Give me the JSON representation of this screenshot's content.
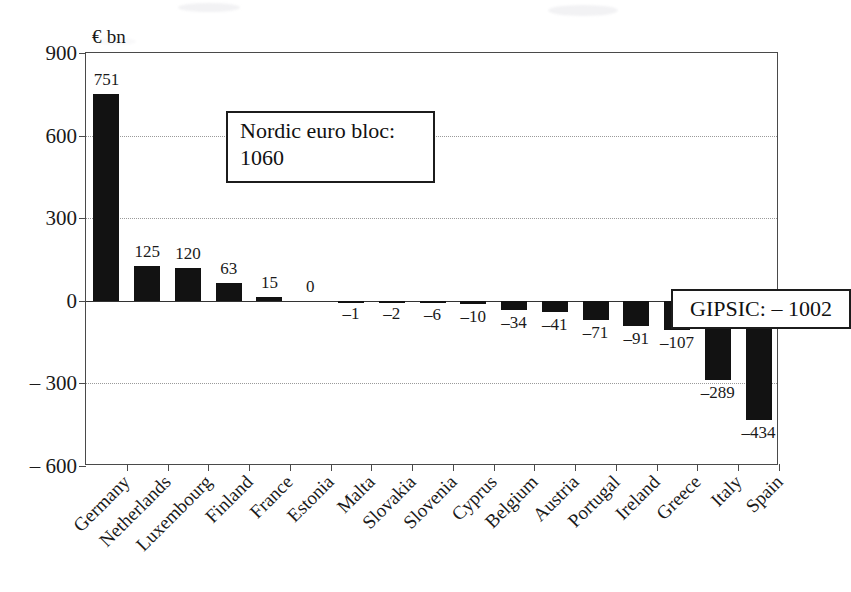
{
  "chart_data": {
    "type": "bar",
    "title": "",
    "subtitle": "",
    "xlabel": "",
    "ylabel": "€ bn",
    "ylim": [
      -600,
      900
    ],
    "grid": true,
    "legend": "none",
    "categories": [
      "Germany",
      "Netherlands",
      "Luxembourg",
      "Finland",
      "France",
      "Estonia",
      "Malta",
      "Slovakia",
      "Slovenia",
      "Cyprus",
      "Belgium",
      "Austria",
      "Portugal",
      "Ireland",
      "Greece",
      "Italy",
      "Spain"
    ],
    "values": [
      751,
      125,
      120,
      63,
      15,
      0,
      -1,
      -2,
      -6,
      -10,
      -34,
      -41,
      -71,
      -91,
      -107,
      -289,
      -434
    ],
    "value_labels": [
      "751",
      "125",
      "120",
      "63",
      "15",
      "0",
      "–1",
      "–2",
      "–6",
      "–10",
      "–34",
      "–41",
      "–71",
      "–91",
      "–107",
      "–289",
      "–434"
    ],
    "y_ticks": [
      900,
      600,
      300,
      0,
      -300,
      -600
    ],
    "y_tick_labels": [
      "900",
      "600",
      "300",
      "0",
      "– 300",
      "– 600"
    ],
    "bar_color": "#121212",
    "annotations": [
      {
        "name": "nordic-euro-bloc",
        "line1": "Nordic euro bloc:",
        "line2": "1060"
      },
      {
        "name": "gipsic",
        "text": "GIPSIC: – 1002"
      }
    ]
  },
  "axis": {
    "unit_label": "€ bn"
  }
}
